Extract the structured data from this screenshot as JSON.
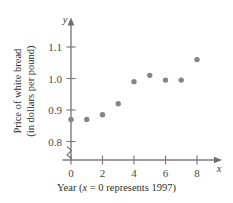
{
  "chart_data": {
    "type": "scatter",
    "title": "",
    "xlabel": "Year (x = 0 represents 1997)",
    "ylabel_line1": "Price of white bread",
    "ylabel_line2": "(in dollars per pound)",
    "x_axis_variable": "x",
    "y_axis_variable": "y",
    "xlim": [
      0,
      9
    ],
    "ylim": [
      0.78,
      1.14
    ],
    "y_axis_break": true,
    "grid": false,
    "legend": null,
    "xticks": [
      0,
      2,
      4,
      6,
      8
    ],
    "xtick_labels": [
      "0",
      "2",
      "4",
      "6",
      "8"
    ],
    "yticks": [
      0.8,
      0.9,
      1.0,
      1.1
    ],
    "ytick_labels": [
      "0.8",
      "0.9",
      "1.0",
      "1.1"
    ],
    "x": [
      0,
      1,
      2,
      3,
      4,
      5,
      6,
      7,
      8
    ],
    "y": [
      0.87,
      0.87,
      0.885,
      0.92,
      0.99,
      1.01,
      0.995,
      0.995,
      1.06
    ],
    "points": [
      {
        "x": 0,
        "y": 0.87
      },
      {
        "x": 1,
        "y": 0.87
      },
      {
        "x": 2,
        "y": 0.885
      },
      {
        "x": 3,
        "y": 0.92
      },
      {
        "x": 4,
        "y": 0.99
      },
      {
        "x": 5,
        "y": 1.01
      },
      {
        "x": 6,
        "y": 0.995
      },
      {
        "x": 7,
        "y": 0.995
      },
      {
        "x": 8,
        "y": 1.06
      }
    ],
    "marker_color": "#858585",
    "axis_color": "#7d7d7d"
  },
  "xlabel_parts": {
    "prefix": "Year (",
    "variable": "x",
    "suffix": " = 0 represents 1997)"
  }
}
